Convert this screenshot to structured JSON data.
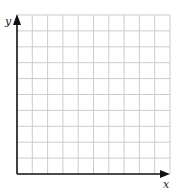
{
  "diagram": {
    "type": "coordinate-grid",
    "x_axis_label": "x",
    "y_axis_label": "y",
    "grid": {
      "columns": 10,
      "rows": 10
    },
    "colors": {
      "grid": "#cccccc",
      "axis": "#111111",
      "background": "#ffffff"
    }
  }
}
